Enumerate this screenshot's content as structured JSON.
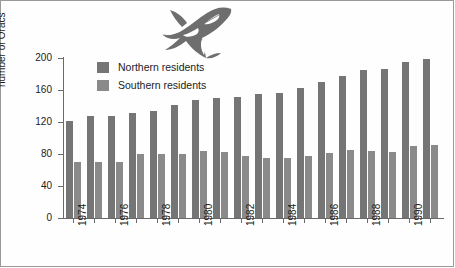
{
  "chart_data": {
    "type": "bar",
    "title": "",
    "xlabel": "",
    "ylabel": "number of Oracs",
    "ylim": [
      0,
      200
    ],
    "yticks": [
      0,
      40,
      80,
      120,
      160,
      200
    ],
    "grid": false,
    "legend_position": "top-left-inside",
    "categories": [
      "1974",
      "1975",
      "1976",
      "1977",
      "1978",
      "1979",
      "1980",
      "1981",
      "1982",
      "1983",
      "1984",
      "1985",
      "1986",
      "1987",
      "1988",
      "1989",
      "1990",
      "1991"
    ],
    "tick_label_years": [
      "1974",
      "1976",
      "1978",
      "1980",
      "1982",
      "1984",
      "1986",
      "1988",
      "1990"
    ],
    "series": [
      {
        "name": "Northern residents",
        "color": "#757575",
        "values": [
          121,
          128,
          128,
          131,
          134,
          141,
          147,
          150,
          151,
          155,
          156,
          163,
          170,
          177,
          185,
          186,
          195,
          199
        ]
      },
      {
        "name": "Southern residents",
        "color": "#8a8a8a",
        "values": [
          70,
          70,
          70,
          80,
          80,
          80,
          84,
          82,
          77,
          75,
          75,
          78,
          81,
          85,
          84,
          82,
          90,
          91
        ]
      }
    ],
    "annotations": [
      "orca-illustration"
    ]
  },
  "legend": {
    "items": [
      {
        "label": "Northern residents",
        "color": "#757575"
      },
      {
        "label": "Southern residents",
        "color": "#8a8a8a"
      }
    ]
  },
  "axis": {
    "y_label": "number of Oracs",
    "y_tick_labels": [
      "200",
      "160",
      "120",
      "80",
      "40",
      "0"
    ]
  },
  "illustration": {
    "name": "orca-whale-illustration"
  },
  "colors": {
    "northern": "#757575",
    "southern": "#8a8a8a",
    "axis": "#6a6a6a",
    "text": "#1c1c1c",
    "background": "#ffffff",
    "border": "#9a9a9a"
  }
}
